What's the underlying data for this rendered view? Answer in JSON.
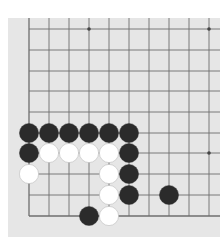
{
  "game": "go",
  "board": {
    "background": "#e6e6e6",
    "line_color": "#6e6e6e",
    "columns_x": [
      21,
      41,
      61,
      81,
      101,
      121,
      141,
      161,
      181,
      201
    ],
    "rows_y": [
      11,
      32,
      53,
      73,
      94,
      115,
      135,
      156,
      177,
      198
    ],
    "visible_edges": [
      "left",
      "bottom"
    ],
    "star_points": [
      [
        3,
        0
      ],
      [
        9,
        0
      ],
      [
        9,
        6
      ]
    ]
  },
  "stones": [
    {
      "color": "black",
      "col": 0,
      "row": 5
    },
    {
      "color": "black",
      "col": 1,
      "row": 5
    },
    {
      "color": "black",
      "col": 2,
      "row": 5
    },
    {
      "color": "black",
      "col": 3,
      "row": 5
    },
    {
      "color": "black",
      "col": 4,
      "row": 5
    },
    {
      "color": "black",
      "col": 5,
      "row": 5
    },
    {
      "color": "black",
      "col": 0,
      "row": 6
    },
    {
      "color": "white",
      "col": 1,
      "row": 6
    },
    {
      "color": "white",
      "col": 2,
      "row": 6
    },
    {
      "color": "white",
      "col": 3,
      "row": 6
    },
    {
      "color": "white",
      "col": 4,
      "row": 6
    },
    {
      "color": "black",
      "col": 5,
      "row": 6
    },
    {
      "color": "white",
      "col": 0,
      "row": 7
    },
    {
      "color": "white",
      "col": 4,
      "row": 7
    },
    {
      "color": "black",
      "col": 5,
      "row": 7
    },
    {
      "color": "white",
      "col": 4,
      "row": 8
    },
    {
      "color": "black",
      "col": 5,
      "row": 8
    },
    {
      "color": "black",
      "col": 7,
      "row": 8
    },
    {
      "color": "black",
      "col": 3,
      "row": 9
    },
    {
      "color": "white",
      "col": 4,
      "row": 9
    }
  ],
  "colors": {
    "black": "#2b2b2b",
    "white": "#ffffff",
    "white_outline": "#bdbdbd"
  }
}
